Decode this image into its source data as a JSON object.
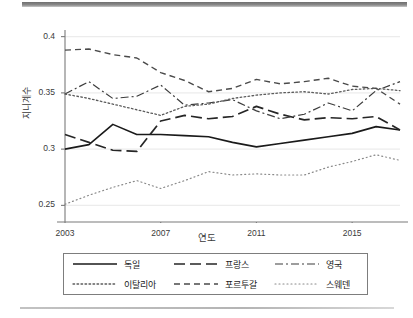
{
  "chart_data": {
    "type": "line",
    "title": "",
    "xlabel": "연도",
    "ylabel": "지니계수",
    "xlim": [
      2003,
      2017
    ],
    "ylim": [
      0.245,
      0.405
    ],
    "grid": true,
    "grid_values": [
      0.25,
      0.3,
      0.35,
      0.4
    ],
    "ytick_labels": [
      "0.25",
      "0.3",
      "0.35",
      "0.4"
    ],
    "ytick_values": [
      0.25,
      0.3,
      0.35,
      0.4
    ],
    "xtick_labels": [
      "2003",
      "2007",
      "2011",
      "2015"
    ],
    "xtick_values": [
      2003,
      2007,
      2011,
      2015
    ],
    "legend_position": "below-plot",
    "x": [
      2003,
      2004,
      2005,
      2006,
      2007,
      2008,
      2009,
      2010,
      2011,
      2012,
      2013,
      2014,
      2015,
      2016,
      2017
    ],
    "series": [
      {
        "name": "독일",
        "dash": "solid",
        "color": "#1a1a1a",
        "values": [
          0.3,
          0.304,
          0.322,
          0.313,
          0.313,
          0.312,
          0.311,
          0.306,
          0.302,
          0.305,
          0.308,
          0.311,
          0.314,
          0.32,
          0.317
        ]
      },
      {
        "name": "프랑스",
        "dash": "long-dash",
        "color": "#262626",
        "values": [
          0.313,
          0.306,
          0.299,
          0.298,
          0.325,
          0.33,
          0.327,
          0.329,
          0.338,
          0.331,
          0.326,
          0.328,
          0.327,
          0.329,
          0.317
        ]
      },
      {
        "name": "영국",
        "dash": "dash-dot",
        "color": "#3d3d3d",
        "values": [
          0.349,
          0.36,
          0.345,
          0.347,
          0.357,
          0.339,
          0.341,
          0.344,
          0.334,
          0.327,
          0.331,
          0.341,
          0.334,
          0.352,
          0.36
        ]
      },
      {
        "name": "이탈리아",
        "dash": "dotted",
        "color": "#5c5c5c",
        "values": [
          0.349,
          0.345,
          0.34,
          0.335,
          0.33,
          0.338,
          0.34,
          0.345,
          0.348,
          0.35,
          0.351,
          0.349,
          0.353,
          0.354,
          0.352
        ]
      },
      {
        "name": "포르투갈",
        "dash": "dashed",
        "color": "#4a4a4a",
        "values": [
          0.388,
          0.389,
          0.384,
          0.381,
          0.368,
          0.361,
          0.351,
          0.354,
          0.362,
          0.358,
          0.36,
          0.363,
          0.356,
          0.354,
          0.34
        ]
      },
      {
        "name": "스웨덴",
        "dash": "fine-dotted",
        "color": "#8a8a8a",
        "values": [
          0.251,
          0.259,
          0.266,
          0.272,
          0.265,
          0.272,
          0.28,
          0.277,
          0.278,
          0.277,
          0.277,
          0.284,
          0.289,
          0.295,
          0.29
        ]
      }
    ]
  },
  "legend": {
    "entries": [
      {
        "label": "독일"
      },
      {
        "label": "프랑스"
      },
      {
        "label": "영국"
      },
      {
        "label": "이탈리아"
      },
      {
        "label": "포르투갈"
      },
      {
        "label": "스웨덴"
      }
    ]
  }
}
